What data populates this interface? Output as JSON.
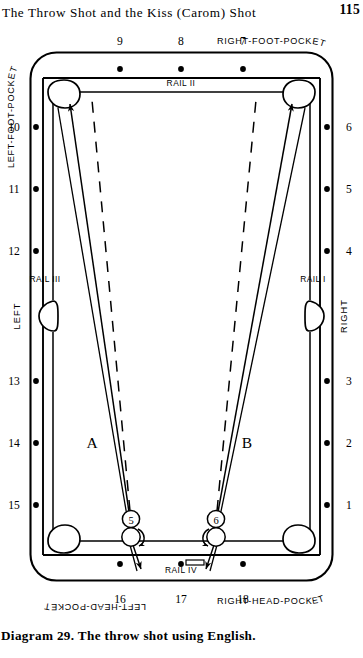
{
  "header": {
    "title": "The Throw Shot and the Kiss (Carom) Shot",
    "page_number": "115"
  },
  "caption": {
    "text": "Diagram 29. The throw shot using English."
  },
  "diagram": {
    "pockets": {
      "top_left": "LEFT-FOOT-POCKET",
      "top_right": "RIGHT-FOOT-POCKET",
      "bottom_left": "LEFT-HEAD-POCKET",
      "bottom_right": "RIGHT-HEAD-POCKET"
    },
    "rails": {
      "top": "RAIL II",
      "right": "RAIL I",
      "left": "RAIL III",
      "bottom": "RAIL IV"
    },
    "side_labels": {
      "left": "LEFT",
      "right": "RIGHT"
    },
    "diamonds": {
      "top": [
        "9",
        "8",
        "7"
      ],
      "right": [
        "6",
        "5",
        "4",
        "3",
        "2",
        "1"
      ],
      "bottom": [
        "16",
        "17",
        "18"
      ],
      "left": [
        "10",
        "11",
        "12",
        "13",
        "14",
        "15"
      ]
    },
    "zones": [
      {
        "label": "A",
        "x": 92,
        "y": 424
      },
      {
        "label": "B",
        "x": 247,
        "y": 424
      }
    ],
    "balls": [
      {
        "number": "5",
        "zone": "A",
        "cx": 131,
        "cy": 495,
        "cue_cx": 131,
        "cue_cy": 513,
        "spin": "right-english-clockwise"
      },
      {
        "number": "6",
        "zone": "B",
        "cx": 216,
        "cy": 495,
        "cue_cx": 216,
        "cue_cy": 513,
        "spin": "left-english-counterclockwise"
      }
    ],
    "colors": {
      "ink": "#000000",
      "paper": "#ffffff"
    }
  }
}
